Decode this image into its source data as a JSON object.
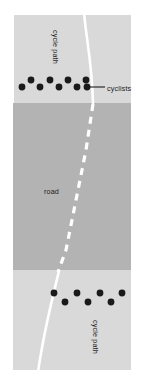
{
  "figure": {
    "background_color": "#ffffff",
    "width": 145,
    "height": 390
  },
  "colors": {
    "cycle_path_fill": "#d9d9d9",
    "road_fill": "#b3b3b3",
    "lane_marking": "#ffffff",
    "path_edge_line": "#ffffff",
    "cyclist_dot": "#1a1a1a",
    "leader_line": "#1a1a1a",
    "label_text": "#222222"
  },
  "labels": {
    "cycle_path_top": "cycle path",
    "cycle_path_bottom": "cycle path",
    "road": "road",
    "cyclists": "cyclists"
  },
  "regions": [
    {
      "name": "cycle-path-top",
      "label": "cycle path",
      "fill": "#d9d9d9",
      "x": 14,
      "y": 15,
      "width": 117,
      "height": 88
    },
    {
      "name": "road",
      "label": "road",
      "fill": "#b3b3b3",
      "x": 13,
      "y": 103,
      "width": 118,
      "height": 167
    },
    {
      "name": "cycle-path-bottom",
      "label": "cycle path",
      "fill": "#d9d9d9",
      "x": 13,
      "y": 270,
      "width": 118,
      "height": 100
    }
  ],
  "cyclists": {
    "label": "cyclists",
    "radius": 3.4,
    "top_group": {
      "count": 9,
      "points": [
        {
          "x": 22,
          "y": 87
        },
        {
          "x": 31,
          "y": 80
        },
        {
          "x": 40,
          "y": 87
        },
        {
          "x": 50,
          "y": 80
        },
        {
          "x": 59,
          "y": 87
        },
        {
          "x": 68,
          "y": 80
        },
        {
          "x": 77,
          "y": 87
        },
        {
          "x": 86,
          "y": 80
        },
        {
          "x": 87,
          "y": 87
        }
      ]
    },
    "bottom_group": {
      "count": 7,
      "points": [
        {
          "x": 54,
          "y": 293
        },
        {
          "x": 65,
          "y": 302
        },
        {
          "x": 77,
          "y": 293
        },
        {
          "x": 88,
          "y": 302
        },
        {
          "x": 100,
          "y": 293
        },
        {
          "x": 111,
          "y": 302
        },
        {
          "x": 122,
          "y": 293
        }
      ]
    }
  },
  "annotation": {
    "cyclists_leader": {
      "label": "cyclists",
      "from_x": 90,
      "from_y": 87,
      "to_x": 105,
      "to_y": 87,
      "text_x": 107,
      "text_y": 89.5
    }
  },
  "lane_marking": {
    "style": "dashed",
    "dash_pattern": "7 6",
    "stroke_width": 3.2,
    "path": "M 93 104 L 86 150 L 76 200 L 66 250 L 58 272"
  },
  "path_edges": {
    "top_curve": "M 84 12 C 86 38, 92 62, 93 103",
    "bottom_curve": "M 59 271 C 52 300, 44 330, 38 372"
  },
  "text_placement": {
    "cycle_path_top": {
      "x": 53,
      "y": 30,
      "rotation": 90
    },
    "cycle_path_bottom": {
      "x": 93,
      "y": 320,
      "rotation": 90
    },
    "road": {
      "x": 44,
      "y": 192,
      "rotation": 0
    }
  }
}
